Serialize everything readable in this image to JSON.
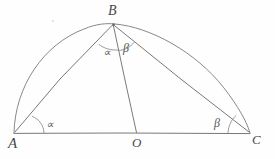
{
  "figure": {
    "kind": "hand-drawn-geometry-diagram",
    "background_color": "#fefefe",
    "ink_color": "#6b6b6b",
    "vertices": [
      {
        "id": "A",
        "label": "A",
        "x": 14,
        "y": 133
      },
      {
        "id": "B",
        "label": "B",
        "x": 113,
        "y": 24
      },
      {
        "id": "C",
        "label": "C",
        "x": 250,
        "y": 133
      },
      {
        "id": "O",
        "label": "O",
        "x": 137,
        "y": 133
      }
    ],
    "angles": [
      {
        "id": "angle-at-a",
        "label": "∝",
        "at": "A",
        "x": 46,
        "y": 119
      },
      {
        "id": "angle-alpha-at-b",
        "label": "∝",
        "at": "B",
        "x": 103,
        "y": 47
      },
      {
        "id": "angle-beta-at-b",
        "label": "β",
        "at": "B",
        "x": 123,
        "y": 42
      },
      {
        "id": "angle-at-c",
        "label": "β",
        "at": "C",
        "x": 214,
        "y": 117
      }
    ],
    "segments": [
      {
        "id": "segment-ac",
        "from": "A",
        "to": "C",
        "name": "baseline-diameter"
      },
      {
        "id": "segment-ab",
        "from": "A",
        "to": "B",
        "name": "chord-ab"
      },
      {
        "id": "segment-bo",
        "from": "B",
        "to": "O",
        "name": "radius-bo"
      },
      {
        "id": "segment-bc",
        "from": "B",
        "to": "C",
        "name": "chord-bc"
      }
    ],
    "arc": {
      "id": "semicircle-arc",
      "center_x": 132,
      "center_y": 133,
      "radius": 118,
      "from_angle_deg": 180,
      "to_angle_deg": 0
    }
  }
}
